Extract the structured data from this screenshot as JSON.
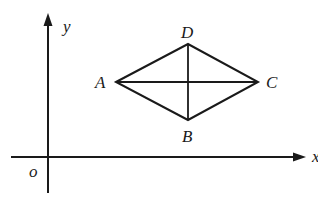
{
  "diagram": {
    "type": "coordinate-geometry",
    "axes": {
      "x_label": "x",
      "y_label": "y",
      "origin_label": "o"
    },
    "vertices": [
      {
        "label": "A",
        "position": "left"
      },
      {
        "label": "B",
        "position": "bottom"
      },
      {
        "label": "C",
        "position": "right"
      },
      {
        "label": "D",
        "position": "top"
      }
    ],
    "edges": [
      "AD",
      "DC",
      "CB",
      "BA"
    ],
    "diagonals": [
      "AC",
      "BD"
    ],
    "line_color": "#1a1a1a"
  }
}
